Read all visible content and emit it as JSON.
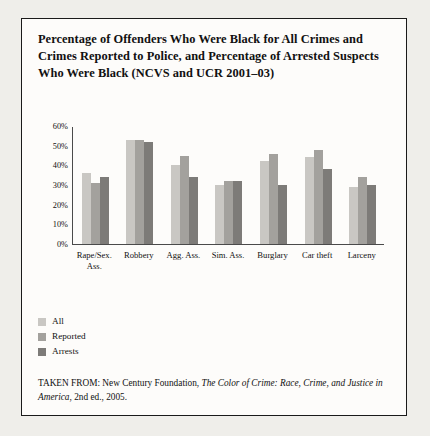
{
  "figure": {
    "title": "Percentage of Offenders Who Were Black for All Crimes and Crimes Reported to Police, and Percentage of Arrested Suspects Who Were Black (NCVS and UCR 2001–03)",
    "source_prefix": "TAKEN FROM: New Century Foundation, ",
    "source_italic_1": "The Color of Crime: Race, Crime, and Justice in America",
    "source_suffix": ", 2nd ed., 2005."
  },
  "colors": {
    "series_all": "#c9c7c3",
    "series_reported": "#a3a19d",
    "series_arrests": "#7d7b78",
    "axis": "#4a4a4a",
    "frame": "#1a1a1a",
    "page_background": "#efeeea",
    "figure_background": "#fdfcfa"
  },
  "chart_data": {
    "type": "bar",
    "title": "Percentage of Offenders Who Were Black for All Crimes and Crimes Reported to Police, and Percentage of Arrested Suspects Who Were Black (NCVS and UCR 2001–03)",
    "xlabel": "",
    "ylabel": "",
    "ylim": [
      0,
      60
    ],
    "ytick_labels": [
      "60%",
      "50%",
      "40%",
      "30%",
      "20%",
      "10%",
      "0%"
    ],
    "ytick_values": [
      60,
      50,
      40,
      30,
      20,
      10,
      0
    ],
    "grid": false,
    "legend_position": "below-left",
    "categories": [
      "Rape/Sex. Ass.",
      "Robbery",
      "Agg. Ass.",
      "Sim. Ass.",
      "Burglary",
      "Car theft",
      "Larceny"
    ],
    "category_lines": [
      [
        "Rape/Sex.",
        "Ass."
      ],
      [
        "Robbery"
      ],
      [
        "Agg. Ass."
      ],
      [
        "Sim. Ass."
      ],
      [
        "Burglary"
      ],
      [
        "Car theft"
      ],
      [
        "Larceny"
      ]
    ],
    "series": [
      {
        "name": "All",
        "values": [
          36,
          53,
          40,
          30,
          42,
          44,
          29
        ]
      },
      {
        "name": "Reported",
        "values": [
          31,
          53,
          45,
          32,
          46,
          48,
          34
        ]
      },
      {
        "name": "Arrests",
        "values": [
          34,
          52,
          34,
          32,
          30,
          38,
          30
        ]
      }
    ]
  },
  "legend": {
    "items": [
      {
        "label": "All",
        "color": "#c9c7c3"
      },
      {
        "label": "Reported",
        "color": "#a3a19d"
      },
      {
        "label": "Arrests",
        "color": "#7d7b78"
      }
    ]
  }
}
